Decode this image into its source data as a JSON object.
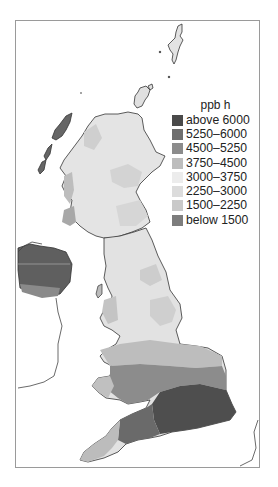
{
  "figure": {
    "type": "choropleth map",
    "region": "United Kingdom"
  },
  "legend": {
    "title": "ppb h",
    "items": [
      {
        "label": "above 6000",
        "color": "#4a4a4a"
      },
      {
        "label": "5250–6000",
        "color": "#6e6e6e"
      },
      {
        "label": "4500–5250",
        "color": "#8c8c8c"
      },
      {
        "label": "3750–4500",
        "color": "#bdbdbd"
      },
      {
        "label": "3000–3750",
        "color": "#ececec"
      },
      {
        "label": "2250–3000",
        "color": "#dcdcdc"
      },
      {
        "label": "1500–2250",
        "color": "#c9c9c9"
      },
      {
        "label": "below 1500",
        "color": "#7d7d7d"
      }
    ]
  },
  "colors": {
    "outline": "#333333",
    "frame": "#9a9a9a",
    "sea": "#ffffff"
  }
}
